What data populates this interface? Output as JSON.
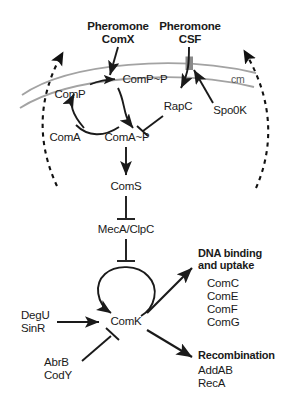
{
  "figure": {
    "colors": {
      "ink": "#1a1a1a",
      "membrane": "#9e9e9e",
      "transporter": "#7a7a7a",
      "cell_outline": "#111111",
      "background": "#ffffff"
    }
  },
  "pheromones": {
    "comx": {
      "line1": "Pheromone",
      "line2": "ComX"
    },
    "csf": {
      "line1": "Pheromone",
      "line2": "CSF"
    }
  },
  "membrane": {
    "label": "cm",
    "transporter_name": "Spo0K"
  },
  "nodes": {
    "comp": "ComP",
    "comp_p": "ComP~P",
    "coma": "ComA",
    "coma_p": "ComA~P",
    "rapc": "RapC",
    "spo0k": "Spo0K",
    "coms": "ComS",
    "meca_clpc": "MecA/ClpC",
    "comk": "ComK"
  },
  "regulators": {
    "activators": {
      "line1": "DegU",
      "line2": "SinR"
    },
    "repressors": {
      "line1": "AbrB",
      "line2": "CodY"
    }
  },
  "outputs": [
    {
      "title_line1": "DNA binding",
      "title_line2": "and uptake",
      "genes": [
        "ComC",
        "ComE",
        "ComF",
        "ComG"
      ]
    },
    {
      "title_line1": "Recombination",
      "title_line2": "",
      "genes": [
        "AddAB",
        "RecA"
      ]
    }
  ]
}
